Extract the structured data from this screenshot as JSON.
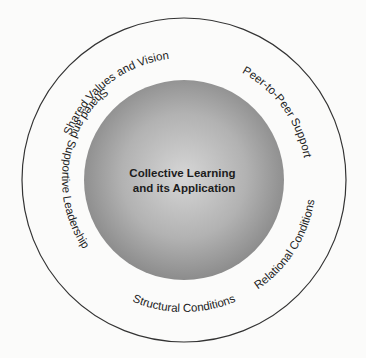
{
  "diagram": {
    "center": {
      "line1": "Collective Learning",
      "line2": "and its Application"
    },
    "ring_labels": [
      "Shared Values and Vision",
      "Peer-to-Peer Support",
      "Relational Conditions",
      "Structural Conditions",
      "Shared and Supportive Leadership"
    ],
    "colors": {
      "background": "#fbfbfa",
      "outer_ring_stroke": "#333333",
      "inner_circle_light": "#d4d4d4",
      "inner_circle_dark": "#8a8a8a",
      "text": "#222222"
    }
  }
}
